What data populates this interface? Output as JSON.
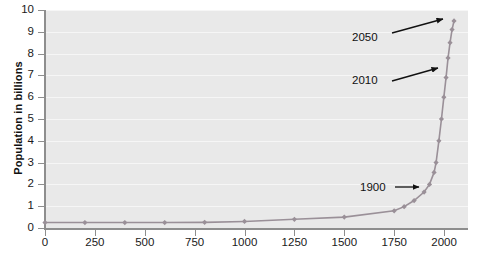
{
  "chart_data": {
    "type": "line",
    "title": "",
    "xlabel": "",
    "ylabel": "Population in billions",
    "xlim": [
      0,
      2120
    ],
    "ylim": [
      0,
      10
    ],
    "grid": true,
    "legend": "none",
    "series_color": "#9a9098",
    "marker": "diamond",
    "x": [
      0,
      200,
      400,
      600,
      800,
      1000,
      1250,
      1500,
      1750,
      1800,
      1850,
      1900,
      1927,
      1950,
      1960,
      1974,
      1987,
      1999,
      2010,
      2020,
      2030,
      2040,
      2050
    ],
    "values": [
      0.25,
      0.25,
      0.25,
      0.25,
      0.26,
      0.3,
      0.4,
      0.5,
      0.79,
      0.98,
      1.26,
      1.65,
      2.0,
      2.55,
      3.0,
      4.0,
      5.0,
      6.0,
      6.9,
      7.8,
      8.5,
      9.1,
      9.5
    ],
    "series": [
      {
        "name": "World population",
        "values": [
          0.25,
          0.25,
          0.25,
          0.25,
          0.26,
          0.3,
          0.4,
          0.5,
          0.79,
          0.98,
          1.26,
          1.65,
          2.0,
          2.55,
          3.0,
          4.0,
          5.0,
          6.0,
          6.9,
          7.8,
          8.5,
          9.1,
          9.5
        ]
      }
    ],
    "xticks": [
      "0",
      "250",
      "500",
      "750",
      "1000",
      "1250",
      "1500",
      "1750",
      "2000"
    ],
    "xtick_values": [
      0,
      250,
      500,
      750,
      1000,
      1250,
      1500,
      1750,
      2000
    ],
    "yticks": [
      "0",
      "1",
      "2",
      "3",
      "4",
      "5",
      "6",
      "7",
      "8",
      "9",
      "10"
    ],
    "ytick_values": [
      0,
      1,
      2,
      3,
      4,
      5,
      6,
      7,
      8,
      9,
      10
    ],
    "annotations": [
      {
        "text": "2050",
        "point_x": 2050,
        "point_y": 9.5
      },
      {
        "text": "2010",
        "point_x": 2010,
        "point_y": 6.9
      },
      {
        "text": "1900",
        "point_x": 1900,
        "point_y": 1.65
      }
    ]
  },
  "colors": {
    "plot_background": "#e9e9e9",
    "gridline": "#f6f6f6",
    "axis": "#8e8e8e",
    "series": "#9a9098",
    "annotation": "#111111",
    "tick_text": "#1a1a1a"
  }
}
